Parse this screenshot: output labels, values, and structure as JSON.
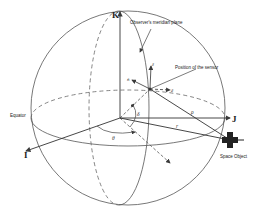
{
  "diagram": {
    "axes": {
      "i_label": "I",
      "j_label": "J",
      "k_label": "K"
    },
    "labels": {
      "meridian_plane": "Observer's meridian plane",
      "sensor_position": "Position of the sensor",
      "equator": "Equator",
      "space_object": "Space Object"
    },
    "symbols": {
      "theta": "θ",
      "delta": "δ",
      "rho": "ρ",
      "r": "r",
      "z_hat": "ẑ",
      "n_hat": "n̂",
      "e_hat": "ê"
    },
    "colors": {
      "line": "#3a3a3a",
      "text": "#222222",
      "background": "#ffffff"
    }
  }
}
